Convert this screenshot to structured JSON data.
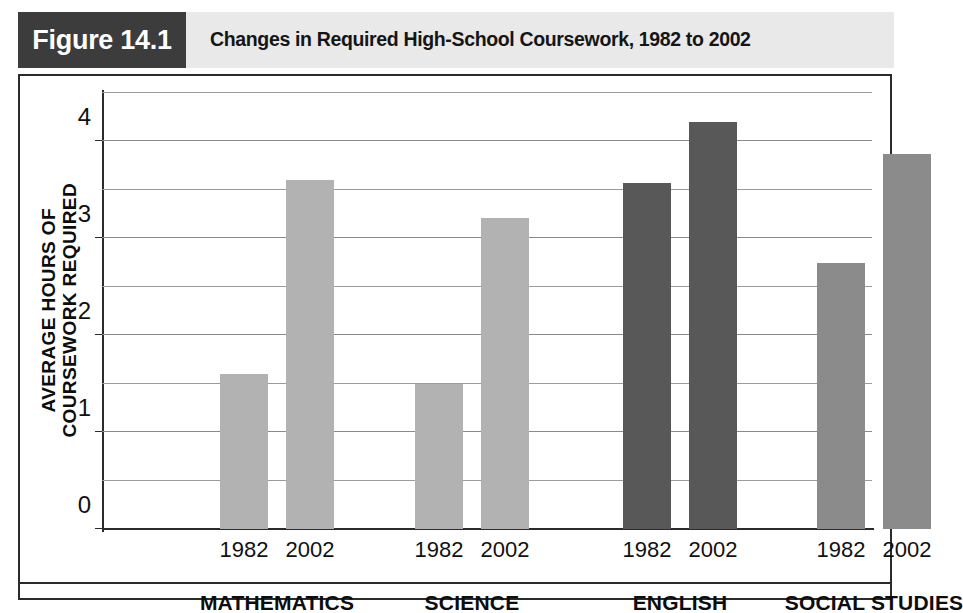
{
  "header": {
    "figure_number": "Figure 14.1",
    "title": "Changes in Required High-School Coursework, 1982 to 2002",
    "number_box_color": "#3c3c3c",
    "title_box_color": "#e9e9e9"
  },
  "chart_data": {
    "type": "bar",
    "title": "Changes in Required High-School Coursework, 1982 to 2002",
    "xlabel": "",
    "ylabel": "AVERAGE HOURS OF COURSEWORK REQUIRED",
    "ylabel_lines": [
      "AVERAGE HOURS OF",
      "COURSEWORK REQUIRED"
    ],
    "ylim": [
      0,
      4.5
    ],
    "ytick_labels": [
      "0",
      "1",
      "2",
      "3",
      "4"
    ],
    "ytick_values": [
      0,
      1,
      2,
      3,
      4
    ],
    "gridlines_at": [
      0.5,
      1,
      1.5,
      2,
      2.5,
      3,
      3.5,
      4,
      4.5
    ],
    "grid": true,
    "legend": "none",
    "categories": [
      "MATHEMATICS",
      "SCIENCE",
      "ENGLISH",
      "SOCIAL STUDIES"
    ],
    "series": [
      {
        "name": "1982",
        "values": [
          1.6,
          1.5,
          3.57,
          2.75
        ]
      },
      {
        "name": "2002",
        "values": [
          3.6,
          3.21,
          4.2,
          3.87
        ]
      }
    ],
    "bars": [
      {
        "group": "MATHEMATICS",
        "year": "1982",
        "value": 1.6,
        "color": "#b2b2b2"
      },
      {
        "group": "MATHEMATICS",
        "year": "2002",
        "value": 3.6,
        "color": "#b2b2b2"
      },
      {
        "group": "SCIENCE",
        "year": "1982",
        "value": 1.5,
        "color": "#b2b2b2"
      },
      {
        "group": "SCIENCE",
        "year": "2002",
        "value": 3.21,
        "color": "#b2b2b2"
      },
      {
        "group": "ENGLISH",
        "year": "1982",
        "value": 3.57,
        "color": "#585858"
      },
      {
        "group": "ENGLISH",
        "year": "2002",
        "value": 4.2,
        "color": "#585858"
      },
      {
        "group": "SOCIAL STUDIES",
        "year": "1982",
        "value": 2.75,
        "color": "#8b8b8b"
      },
      {
        "group": "SOCIAL STUDIES",
        "year": "2002",
        "value": 3.87,
        "color": "#8b8b8b"
      }
    ],
    "group_year_labels": [
      "1982",
      "2002",
      "1982",
      "2002",
      "1982",
      "2002",
      "1982",
      "2002"
    ]
  },
  "colors": {
    "bar_light": "#b2b2b2",
    "bar_dark": "#585858",
    "bar_medium": "#8b8b8b",
    "frame": "#2b2b2b",
    "grid": "#9a9a9a"
  }
}
